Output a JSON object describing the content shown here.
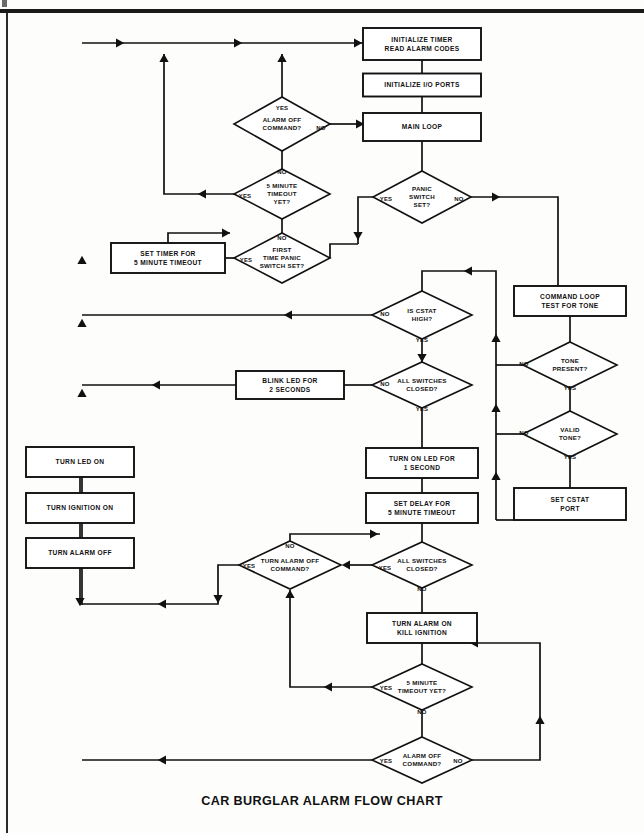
{
  "document": {
    "title": "CAR BURGLAR ALARM FLOW CHART",
    "title_x": 322,
    "title_y": 805
  },
  "chart_data": {
    "type": "diagram",
    "subtype": "flowchart",
    "title": "CAR BURGLAR ALARM FLOW CHART",
    "orientation": "top-down",
    "ink_color": "#111111",
    "paper_color": "#ffffff",
    "nodes": [
      {
        "id": "init_timer",
        "shape": "process",
        "text": [
          "INITIALIZE TIMER",
          "READ ALARM CODES"
        ],
        "x": 422,
        "y": 44,
        "w": 118,
        "h": 32
      },
      {
        "id": "init_io",
        "shape": "process",
        "text": [
          "INITIALIZE I/O PORTS"
        ],
        "x": 422,
        "y": 85,
        "w": 118,
        "h": 23
      },
      {
        "id": "main_loop",
        "shape": "process",
        "text": [
          "MAIN LOOP"
        ],
        "x": 422,
        "y": 127,
        "w": 118,
        "h": 28
      },
      {
        "id": "alarm_off_1",
        "shape": "decision",
        "text": [
          "ALARM OFF",
          "COMMAND?"
        ],
        "x": 282,
        "y": 124,
        "w": 96,
        "h": 54,
        "yes": "top",
        "no": "right"
      },
      {
        "id": "panic_switch",
        "shape": "decision",
        "text": [
          "PANIC",
          "SWITCH",
          "SET?"
        ],
        "x": 422,
        "y": 197,
        "w": 98,
        "h": 52,
        "yes": "left",
        "no": "right"
      },
      {
        "id": "timeout_5min",
        "shape": "decision",
        "text": [
          "5 MINUTE",
          "TIMEOUT",
          "YET?"
        ],
        "x": 282,
        "y": 194,
        "w": 96,
        "h": 50,
        "yes": "left",
        "no": "top"
      },
      {
        "id": "first_panic",
        "shape": "decision",
        "text": [
          "FIRST",
          "TIME PANIC",
          "SWITCH SET?"
        ],
        "x": 282,
        "y": 258,
        "w": 96,
        "h": 50,
        "yes": "left",
        "no": "top"
      },
      {
        "id": "set_timer",
        "shape": "process",
        "text": [
          "SET TIMER FOR",
          "5 MINUTE TIMEOUT"
        ],
        "x": 168,
        "y": 258,
        "w": 114,
        "h": 30
      },
      {
        "id": "cmd_loop",
        "shape": "process",
        "text": [
          "COMMAND LOOP",
          "TEST FOR TONE"
        ],
        "x": 570,
        "y": 301,
        "w": 112,
        "h": 30
      },
      {
        "id": "cstat_high",
        "shape": "decision",
        "text": [
          "IS CSTAT",
          "HIGH?"
        ],
        "x": 422,
        "y": 315,
        "w": 100,
        "h": 48,
        "yes": "bottom",
        "no": "left"
      },
      {
        "id": "tone_present",
        "shape": "decision",
        "text": [
          "TONE",
          "PRESENT?"
        ],
        "x": 570,
        "y": 365,
        "w": 94,
        "h": 46,
        "yes": "bottom",
        "no": "left"
      },
      {
        "id": "all_sw_1",
        "shape": "decision",
        "text": [
          "ALL SWITCHES",
          "CLOSED?"
        ],
        "x": 422,
        "y": 385,
        "w": 100,
        "h": 46,
        "yes": "bottom",
        "no": "left"
      },
      {
        "id": "blink_led",
        "shape": "process",
        "text": [
          "BLINK LED FOR",
          "2 SECONDS"
        ],
        "x": 290,
        "y": 385,
        "w": 108,
        "h": 28
      },
      {
        "id": "valid_tone",
        "shape": "decision",
        "text": [
          "VALID",
          "TONE?"
        ],
        "x": 570,
        "y": 434,
        "w": 94,
        "h": 46,
        "yes": "bottom",
        "no": "left"
      },
      {
        "id": "led_1sec",
        "shape": "process",
        "text": [
          "TURN ON LED FOR",
          "1 SECOND"
        ],
        "x": 422,
        "y": 463,
        "w": 112,
        "h": 30
      },
      {
        "id": "turn_led_on",
        "shape": "process",
        "text": [
          "TURN LED ON"
        ],
        "x": 80,
        "y": 462,
        "w": 108,
        "h": 30
      },
      {
        "id": "set_cstat",
        "shape": "process",
        "text": [
          "SET CSTAT",
          "PORT"
        ],
        "x": 570,
        "y": 504,
        "w": 112,
        "h": 32
      },
      {
        "id": "set_delay",
        "shape": "process",
        "text": [
          "SET DELAY FOR",
          "5 MINUTE TIMEOUT"
        ],
        "x": 422,
        "y": 508,
        "w": 112,
        "h": 30
      },
      {
        "id": "ignition_on",
        "shape": "process",
        "text": [
          "TURN IGNITION ON"
        ],
        "x": 80,
        "y": 508,
        "w": 108,
        "h": 30
      },
      {
        "id": "alarm_off_box",
        "shape": "process",
        "text": [
          "TURN ALARM OFF"
        ],
        "x": 80,
        "y": 553,
        "w": 108,
        "h": 30
      },
      {
        "id": "alarm_off_2",
        "shape": "decision",
        "text": [
          "TURN ALARM OFF",
          "COMMAND?"
        ],
        "x": 290,
        "y": 565,
        "w": 102,
        "h": 48,
        "yes": "left",
        "no": "top"
      },
      {
        "id": "all_sw_2",
        "shape": "decision",
        "text": [
          "ALL SWITCHES",
          "CLOSED?"
        ],
        "x": 422,
        "y": 565,
        "w": 100,
        "h": 46,
        "yes": "left",
        "no": "bottom"
      },
      {
        "id": "alarm_on",
        "shape": "process",
        "text": [
          "TURN ALARM ON",
          "KILL IGNITION"
        ],
        "x": 422,
        "y": 628,
        "w": 110,
        "h": 30
      },
      {
        "id": "timeout_5_2",
        "shape": "decision",
        "text": [
          "5 MINUTE",
          "TIMEOUT YET?"
        ],
        "x": 422,
        "y": 687,
        "w": 100,
        "h": 46,
        "yes": "left",
        "no": "bottom"
      },
      {
        "id": "alarm_off_3",
        "shape": "decision",
        "text": [
          "ALARM OFF",
          "COMMAND?"
        ],
        "x": 422,
        "y": 760,
        "w": 100,
        "h": 46,
        "yes": "left",
        "no": "right"
      }
    ],
    "branch_labels": [
      {
        "text": "YES",
        "x": 282,
        "y": 108
      },
      {
        "text": "NO",
        "x": 321,
        "y": 128
      },
      {
        "text": "NO",
        "x": 282,
        "y": 172
      },
      {
        "text": "YES",
        "x": 245,
        "y": 196
      },
      {
        "text": "YES",
        "x": 386,
        "y": 199
      },
      {
        "text": "NO",
        "x": 459,
        "y": 199
      },
      {
        "text": "NO",
        "x": 282,
        "y": 238
      },
      {
        "text": "YES",
        "x": 246,
        "y": 260
      },
      {
        "text": "NO",
        "x": 385,
        "y": 314
      },
      {
        "text": "YES",
        "x": 422,
        "y": 340
      },
      {
        "text": "NO",
        "x": 385,
        "y": 384
      },
      {
        "text": "YES",
        "x": 422,
        "y": 409
      },
      {
        "text": "NO",
        "x": 524,
        "y": 364
      },
      {
        "text": "YES",
        "x": 570,
        "y": 388
      },
      {
        "text": "NO",
        "x": 524,
        "y": 433
      },
      {
        "text": "YES",
        "x": 570,
        "y": 457
      },
      {
        "text": "NO",
        "x": 290,
        "y": 546
      },
      {
        "text": "YES",
        "x": 249,
        "y": 566
      },
      {
        "text": "YES",
        "x": 385,
        "y": 568
      },
      {
        "text": "NO",
        "x": 422,
        "y": 589
      },
      {
        "text": "YES",
        "x": 386,
        "y": 688
      },
      {
        "text": "NO",
        "x": 422,
        "y": 712
      },
      {
        "text": "YES",
        "x": 386,
        "y": 761
      },
      {
        "text": "NO",
        "x": 458,
        "y": 761
      }
    ],
    "connectors": [
      {
        "name": "start-rail-to-init",
        "path": "M 82,43 L 412,43",
        "arrows": [
          [
            118,
            43,
            "right"
          ],
          [
            236,
            43,
            "right"
          ],
          [
            356,
            43,
            "right"
          ]
        ]
      },
      {
        "name": "init-timer-to-init-io",
        "path": "M 422,60 L 422,73",
        "arrows": []
      },
      {
        "name": "init-io-to-main-loop",
        "path": "M 422,97 L 422,113",
        "arrows": []
      },
      {
        "name": "main-loop-to-panic",
        "path": "M 422,141 L 422,171",
        "arrows": []
      },
      {
        "name": "alarm-off-1-yes-up",
        "path": "M 282,97 L 282,54",
        "arrows": [
          [
            282,
            60,
            "up"
          ]
        ]
      },
      {
        "name": "alarm-off-1-no-right",
        "path": "M 330,124 L 362,124",
        "arrows": [
          [
            358,
            124,
            "right"
          ]
        ]
      },
      {
        "name": "alarm-off-1-no-to-main",
        "path": "M 362,124 L 362,124",
        "arrows": []
      },
      {
        "name": "alarm-off-1-to-timeout",
        "path": "M 282,151 L 282,169",
        "arrows": []
      },
      {
        "name": "timeout-yes-left-up",
        "path": "M 234,194 L 164,194 L 164,54",
        "arrows": [
          [
            204,
            194,
            "left"
          ],
          [
            164,
            60,
            "up"
          ]
        ]
      },
      {
        "name": "timeout-no-down",
        "path": "M 282,219 L 282,233",
        "arrows": []
      },
      {
        "name": "panic-yes-left-down",
        "path": "M 373,197 L 358,197 L 358,238 L 358,244",
        "arrows": [
          [
            358,
            234,
            "down"
          ]
        ]
      },
      {
        "name": "panic-yes-to-first",
        "path": "M 358,244 L 330,244 L 330,258",
        "arrows": []
      },
      {
        "name": "panic-no-right",
        "path": "M 471,197 L 558,197 L 558,286",
        "arrows": [
          [
            494,
            197,
            "right"
          ]
        ]
      },
      {
        "name": "first-panic-yes-left",
        "path": "M 234,258 L 225,258",
        "arrows": []
      },
      {
        "name": "first-panic-no-up-left",
        "path": "M 282,233 L 282,233",
        "arrows": []
      },
      {
        "name": "set-timer-out-up",
        "path": "M 168,243 L 168,233 L 230,233",
        "arrows": [
          [
            224,
            233,
            "right"
          ]
        ]
      },
      {
        "name": "cmd-loop-to-tone",
        "path": "M 570,316 L 570,342",
        "arrows": []
      },
      {
        "name": "cstat-no-left",
        "path": "M 372,315 L 82,315",
        "arrows": [
          [
            290,
            315,
            "left"
          ]
        ]
      },
      {
        "name": "cstat-yes-down",
        "path": "M 422,339 L 422,362",
        "arrows": [
          [
            422,
            356,
            "down"
          ]
        ]
      },
      {
        "name": "all-sw1-no-left",
        "path": "M 372,385 L 344,385",
        "arrows": []
      },
      {
        "name": "blink-led-out-left",
        "path": "M 236,385 L 82,385",
        "arrows": [
          [
            158,
            385,
            "left"
          ]
        ]
      },
      {
        "name": "all-sw1-yes-down",
        "path": "M 422,408 L 422,448",
        "arrows": []
      },
      {
        "name": "tone-no-left",
        "path": "M 523,365 L 496,365",
        "arrows": []
      },
      {
        "name": "tone-yes-down",
        "path": "M 570,388 L 570,411",
        "arrows": []
      },
      {
        "name": "valid-no-left",
        "path": "M 523,434 L 496,434",
        "arrows": []
      },
      {
        "name": "valid-yes-down",
        "path": "M 570,457 L 570,488",
        "arrows": []
      },
      {
        "name": "right-rail-up",
        "path": "M 496,520 L 496,271 L 476,271",
        "arrows": [
          [
            496,
            340,
            "up"
          ],
          [
            496,
            410,
            "up"
          ],
          [
            496,
            478,
            "up"
          ],
          [
            470,
            271,
            "left"
          ]
        ]
      },
      {
        "name": "set-cstat-out-left",
        "path": "M 514,520 L 496,520",
        "arrows": []
      },
      {
        "name": "cstat-top-junction",
        "path": "M 476,271 L 422,271 L 422,291",
        "arrows": []
      },
      {
        "name": "led1s-to-delay",
        "path": "M 422,478 L 422,493",
        "arrows": []
      },
      {
        "name": "delay-to-allsw2",
        "path": "M 422,523 L 422,542",
        "arrows": []
      },
      {
        "name": "turn-led-to-ign",
        "path": "M 80,477 L 80,493",
        "arrows": []
      },
      {
        "name": "ign-to-alarmoff",
        "path": "M 80,523 L 80,538",
        "arrows": []
      },
      {
        "name": "left-rail-up-to-led",
        "path": "M 82,605 L 82,447",
        "arrows": [
          [
            82,
            453,
            "up"
          ],
          [
            82,
            395,
            "up"
          ],
          [
            82,
            325,
            "up"
          ],
          [
            82,
            262,
            "up"
          ]
        ]
      },
      {
        "name": "alarm-off-box-down",
        "path": "M 80,568 L 80,605",
        "arrows": [
          [
            80,
            600,
            "down"
          ]
        ]
      },
      {
        "name": "all-sw2-yes-left",
        "path": "M 372,565 L 344,565",
        "arrows": [
          [
            348,
            565,
            "left"
          ]
        ]
      },
      {
        "name": "all-sw2-no-down",
        "path": "M 422,588 L 422,613",
        "arrows": []
      },
      {
        "name": "alarm-off-2-no-up",
        "path": "M 290,541 L 290,534 L 380,534",
        "arrows": [
          [
            372,
            534,
            "right"
          ]
        ]
      },
      {
        "name": "alarm-off-2-yes-left",
        "path": "M 239,565 L 218,565 L 218,604 L 82,604",
        "arrows": [
          [
            218,
            597,
            "down"
          ],
          [
            164,
            604,
            "left"
          ]
        ]
      },
      {
        "name": "alarm-on-to-timeout2",
        "path": "M 422,643 L 422,664",
        "arrows": []
      },
      {
        "name": "timeout2-yes-left-up",
        "path": "M 372,687 L 290,687 L 290,590",
        "arrows": [
          [
            330,
            687,
            "left"
          ],
          [
            290,
            596,
            "up"
          ]
        ]
      },
      {
        "name": "timeout2-no-down",
        "path": "M 422,710 L 422,737",
        "arrows": []
      },
      {
        "name": "alarm-off-3-yes-left",
        "path": "M 372,760 L 82,760",
        "arrows": [
          [
            164,
            760,
            "left"
          ]
        ]
      },
      {
        "name": "alarm-off-3-no-right-up",
        "path": "M 472,760 L 540,760 L 540,643 L 470,643",
        "arrows": [
          [
            540,
            722,
            "up"
          ],
          [
            476,
            643,
            "left"
          ]
        ]
      }
    ]
  }
}
